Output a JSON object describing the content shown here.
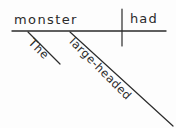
{
  "canvas": {
    "width": 176,
    "height": 128,
    "background_color": "#fdfdfd",
    "ink_color": "#2b2b2b"
  },
  "diagram": {
    "type": "reed-kellogg-sentence-diagram",
    "sentence": "The large-headed monster had",
    "baseline": {
      "x1": 12,
      "y1": 31,
      "x2": 166,
      "y2": 31
    },
    "divider": {
      "x1": 122,
      "y1": 9,
      "x2": 122,
      "y2": 46
    },
    "slants": [
      {
        "name": "article-slant",
        "x1": 28,
        "y1": 32,
        "x2": 60,
        "y2": 64
      },
      {
        "name": "adjective-slant",
        "x1": 70,
        "y1": 32,
        "x2": 173,
        "y2": 126
      }
    ]
  },
  "words": {
    "subject": "monster",
    "verb": "had",
    "article": "The",
    "adjective": "large-headed"
  }
}
